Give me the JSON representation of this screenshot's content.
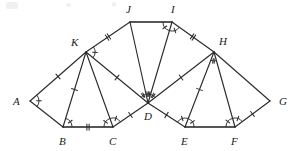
{
  "figure": {
    "background_color": "#ffffff",
    "stroke_color": "#2b2b2b",
    "label_color": "#1a1a1a",
    "width": 298,
    "height": 151
  },
  "vertices": [
    {
      "id": "A",
      "label": "A",
      "x": 30,
      "y": 101,
      "label_x": 13,
      "label_y": 105
    },
    {
      "id": "B",
      "label": "B",
      "x": 63,
      "y": 127,
      "label_x": 59,
      "label_y": 145
    },
    {
      "id": "C",
      "label": "C",
      "x": 113,
      "y": 127,
      "label_x": 109,
      "label_y": 145
    },
    {
      "id": "D",
      "label": "D",
      "x": 148,
      "y": 103,
      "label_x": 144,
      "label_y": 120
    },
    {
      "id": "E",
      "label": "E",
      "x": 185,
      "y": 127,
      "label_x": 181,
      "label_y": 145
    },
    {
      "id": "F",
      "label": "F",
      "x": 235,
      "y": 127,
      "label_x": 231,
      "label_y": 145
    },
    {
      "id": "G",
      "label": "G",
      "x": 270,
      "y": 101,
      "label_x": 279,
      "label_y": 105
    },
    {
      "id": "H",
      "label": "H",
      "x": 214,
      "y": 52,
      "label_x": 219,
      "label_y": 45
    },
    {
      "id": "I",
      "label": "I",
      "x": 172,
      "y": 22,
      "label_x": 171,
      "label_y": 13
    },
    {
      "id": "J",
      "label": "J",
      "x": 130,
      "y": 22,
      "label_x": 126,
      "label_y": 13
    },
    {
      "id": "K",
      "label": "K",
      "x": 86,
      "y": 52,
      "label_x": 71,
      "label_y": 46
    }
  ],
  "segments": [
    {
      "name": "A-K",
      "from": "A",
      "to": "K",
      "ticks": 1,
      "weight": "normal"
    },
    {
      "name": "A-B",
      "from": "A",
      "to": "B",
      "ticks": 0,
      "weight": "normal"
    },
    {
      "name": "K-B",
      "from": "K",
      "to": "B",
      "ticks": 1,
      "weight": "normal"
    },
    {
      "name": "K-C",
      "from": "K",
      "to": "C",
      "ticks": 0,
      "weight": "normal"
    },
    {
      "name": "B-C",
      "from": "B",
      "to": "C",
      "ticks": 2,
      "weight": "thick"
    },
    {
      "name": "K-J",
      "from": "K",
      "to": "J",
      "ticks": 2,
      "weight": "normal"
    },
    {
      "name": "K-D",
      "from": "K",
      "to": "D",
      "ticks": 1,
      "weight": "normal"
    },
    {
      "name": "C-D",
      "from": "C",
      "to": "D",
      "ticks": 1,
      "weight": "normal"
    },
    {
      "name": "J-D",
      "from": "J",
      "to": "D",
      "ticks": 0,
      "weight": "normal"
    },
    {
      "name": "J-I",
      "from": "J",
      "to": "I",
      "ticks": 0,
      "weight": "thick"
    },
    {
      "name": "I-D",
      "from": "I",
      "to": "D",
      "ticks": 0,
      "weight": "normal"
    },
    {
      "name": "I-H",
      "from": "I",
      "to": "H",
      "ticks": 2,
      "weight": "normal"
    },
    {
      "name": "H-D",
      "from": "H",
      "to": "D",
      "ticks": 1,
      "weight": "normal"
    },
    {
      "name": "D-E",
      "from": "D",
      "to": "E",
      "ticks": 1,
      "weight": "normal"
    },
    {
      "name": "H-E",
      "from": "H",
      "to": "E",
      "ticks": 1,
      "weight": "normal"
    },
    {
      "name": "H-F",
      "from": "H",
      "to": "F",
      "ticks": 0,
      "weight": "normal"
    },
    {
      "name": "E-F",
      "from": "E",
      "to": "F",
      "ticks": 0,
      "weight": "thick"
    },
    {
      "name": "H-G",
      "from": "H",
      "to": "G",
      "ticks": 0,
      "weight": "normal"
    },
    {
      "name": "F-G",
      "from": "F",
      "to": "G",
      "ticks": 1,
      "weight": "normal"
    }
  ],
  "angle_marks": [
    {
      "name": "angle-A",
      "vertex": "A",
      "rays": [
        "K",
        "B"
      ],
      "arcs": 1,
      "hatch": 1
    },
    {
      "name": "angle-ABK",
      "vertex": "B",
      "rays": [
        "K",
        "C"
      ],
      "arcs": 1,
      "hatch": 1
    },
    {
      "name": "angle-KCB",
      "vertex": "C",
      "rays": [
        "B",
        "K"
      ],
      "arcs": 1,
      "hatch": 1
    },
    {
      "name": "angle-KCD",
      "vertex": "C",
      "rays": [
        "K",
        "D"
      ],
      "arcs": 1,
      "hatch": 1
    },
    {
      "name": "angle-K-top",
      "vertex": "K",
      "rays": [
        "J",
        "D"
      ],
      "arcs": 1,
      "hatch": 1
    },
    {
      "name": "angle-D-KJ",
      "vertex": "D",
      "rays": [
        "K",
        "J"
      ],
      "arcs": 1,
      "hatch": 2
    },
    {
      "name": "angle-D-JI",
      "vertex": "D",
      "rays": [
        "J",
        "I"
      ],
      "arcs": 1,
      "hatch": 3
    },
    {
      "name": "angle-D-IH",
      "vertex": "D",
      "rays": [
        "I",
        "H"
      ],
      "arcs": 1,
      "hatch": 2
    },
    {
      "name": "angle-I-JD",
      "vertex": "I",
      "rays": [
        "J",
        "D"
      ],
      "arcs": 1,
      "hatch": 1
    },
    {
      "name": "angle-I-DH",
      "vertex": "I",
      "rays": [
        "D",
        "H"
      ],
      "arcs": 1,
      "hatch": 1
    },
    {
      "name": "angle-E-DH",
      "vertex": "E",
      "rays": [
        "D",
        "H"
      ],
      "arcs": 1,
      "hatch": 1
    },
    {
      "name": "angle-E-HF",
      "vertex": "E",
      "rays": [
        "H",
        "F"
      ],
      "arcs": 1,
      "hatch": 1
    },
    {
      "name": "angle-F-HE",
      "vertex": "F",
      "rays": [
        "E",
        "H"
      ],
      "arcs": 1,
      "hatch": 1
    },
    {
      "name": "angle-F-HG",
      "vertex": "F",
      "rays": [
        "H",
        "G"
      ],
      "arcs": 1,
      "hatch": 1
    },
    {
      "name": "angle-H-mid",
      "vertex": "H",
      "rays": [
        "E",
        "F"
      ],
      "arcs": 1,
      "hatch": 2
    }
  ],
  "artifacts": [
    {
      "name": "scan-smudge-top-left",
      "x": 6,
      "y": 2,
      "w": 12,
      "h": 7
    },
    {
      "name": "scan-smudge-top-mid",
      "x": 66,
      "y": 3,
      "w": 5,
      "h": 4
    },
    {
      "name": "scan-smudge-top-right",
      "x": 112,
      "y": 2,
      "w": 4,
      "h": 5
    }
  ]
}
